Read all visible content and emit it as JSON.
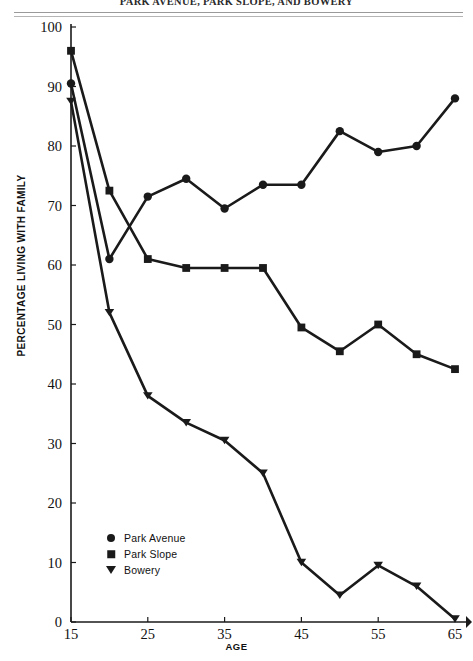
{
  "title": "PARK AVENUE, PARK SLOPE, AND BOWERY",
  "axes": {
    "y_title": "PERCENTAGE LIVING WITH FAMILY",
    "x_title": "AGE"
  },
  "legend": {
    "items": [
      {
        "label": "Park Avenue",
        "marker": "circle-marker"
      },
      {
        "label": "Park Slope",
        "marker": "square-marker"
      },
      {
        "label": "Bowery",
        "marker": "triangle-down-marker"
      }
    ]
  },
  "chart_data": {
    "type": "line",
    "title": "PARK AVENUE, PARK SLOPE, AND BOWERY",
    "xlabel": "AGE",
    "ylabel": "PERCENTAGE LIVING WITH FAMILY",
    "xlim": [
      15,
      65
    ],
    "ylim": [
      0,
      100
    ],
    "grid": false,
    "legend_position": "lower-left-inside",
    "xticks": [
      15,
      25,
      35,
      45,
      55,
      65
    ],
    "yticks": [
      0,
      10,
      20,
      30,
      40,
      50,
      60,
      70,
      80,
      90,
      100
    ],
    "x": [
      15,
      20,
      25,
      30,
      35,
      40,
      45,
      50,
      55,
      60,
      65
    ],
    "series": [
      {
        "name": "Park Avenue",
        "marker": "circle",
        "color": "#1a1a1a",
        "values": [
          90.5,
          61.0,
          71.5,
          74.5,
          69.5,
          73.5,
          73.5,
          82.5,
          79.0,
          80.0,
          88.0
        ]
      },
      {
        "name": "Park Slope",
        "marker": "square",
        "color": "#1a1a1a",
        "values": [
          96.0,
          72.5,
          61.0,
          59.5,
          59.5,
          59.5,
          49.5,
          45.5,
          50.0,
          45.0,
          42.5
        ]
      },
      {
        "name": "Bowery",
        "marker": "triangle-down",
        "color": "#1a1a1a",
        "values": [
          87.5,
          52.0,
          38.0,
          33.5,
          30.5,
          25.0,
          10.0,
          4.5,
          9.5,
          6.0,
          0.5
        ]
      }
    ]
  },
  "colors": {
    "ink": "#1a1a1a",
    "rule": "#9a9a9a",
    "background": "#ffffff"
  }
}
